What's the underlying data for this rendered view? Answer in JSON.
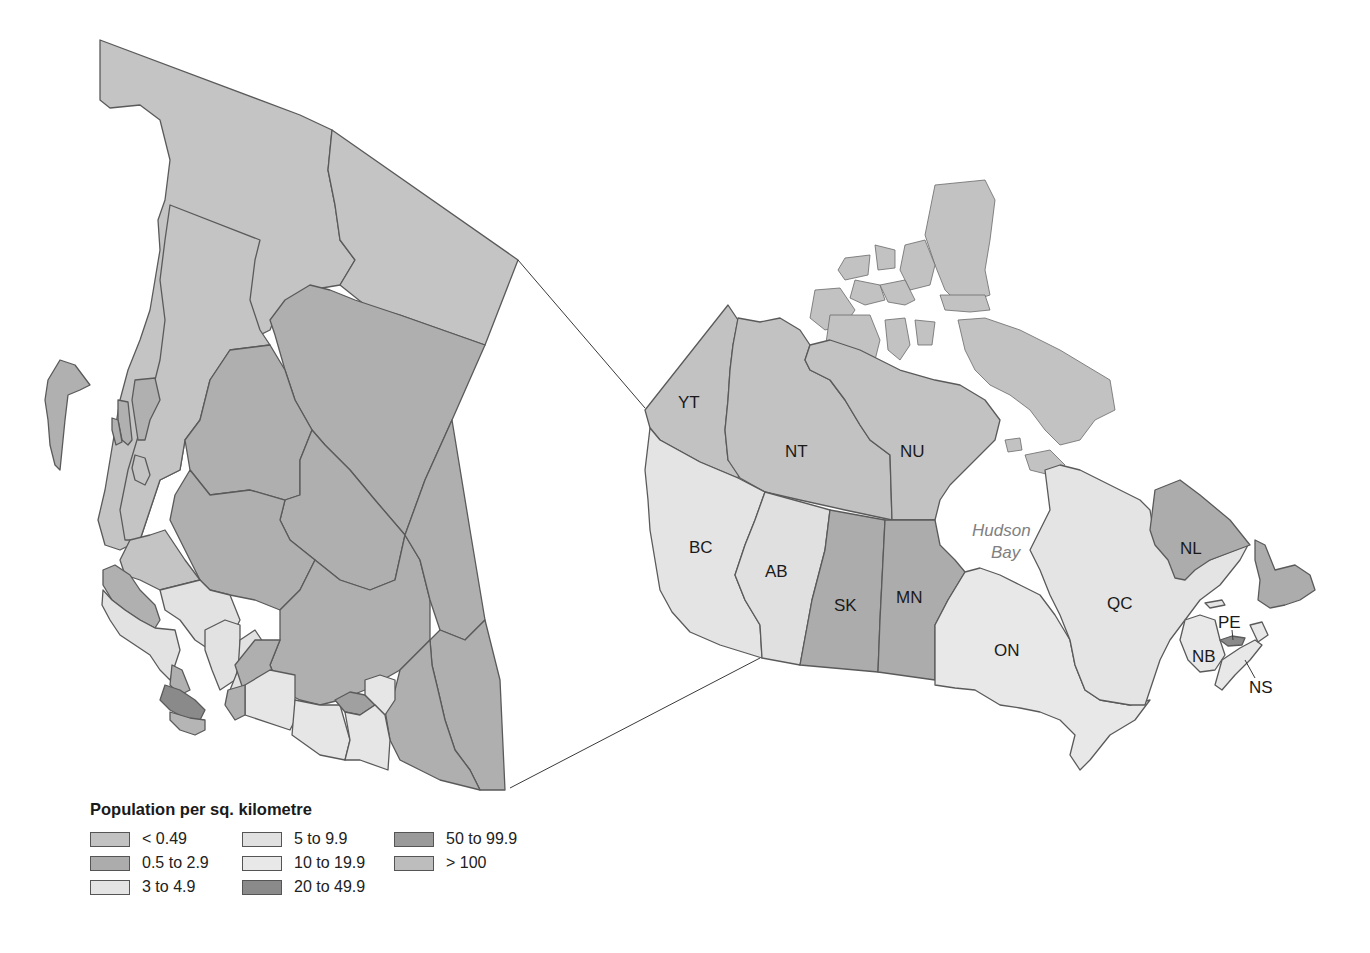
{
  "legend": {
    "title": "Population per sq. kilometre",
    "classes": [
      {
        "label": "< 0.49",
        "color": "#c2c2c2"
      },
      {
        "label": "0.5 to 2.9",
        "color": "#acacac"
      },
      {
        "label": "3 to 4.9",
        "color": "#e4e4e4"
      },
      {
        "label": "5 to 9.9",
        "color": "#e0e0e0"
      },
      {
        "label": "10 to 19.9",
        "color": "#e8e8e8"
      },
      {
        "label": "20 to 49.9",
        "color": "#8a8a8a"
      },
      {
        "label": "50 to 99.9",
        "color": "#9a9a9a"
      },
      {
        "label": "> 100",
        "color": "#bdbdbd"
      }
    ]
  },
  "water_labels": {
    "hudson_bay_line1": "Hudson",
    "hudson_bay_line2": "Bay"
  },
  "provinces": [
    {
      "code": "YT",
      "density_class": "< 0.49"
    },
    {
      "code": "NT",
      "density_class": "< 0.49"
    },
    {
      "code": "NU",
      "density_class": "< 0.49"
    },
    {
      "code": "BC",
      "density_class": "3 to 4.9"
    },
    {
      "code": "AB",
      "density_class": "5 to 9.9"
    },
    {
      "code": "SK",
      "density_class": "0.5 to 2.9"
    },
    {
      "code": "MN",
      "density_class": "0.5 to 2.9"
    },
    {
      "code": "ON",
      "density_class": "10 to 19.9"
    },
    {
      "code": "QC",
      "density_class": "3 to 4.9"
    },
    {
      "code": "NL",
      "density_class": "0.5 to 2.9"
    },
    {
      "code": "NB",
      "density_class": "10 to 19.9"
    },
    {
      "code": "NS",
      "density_class": "10 to 19.9"
    },
    {
      "code": "PE",
      "density_class": "20 to 49.9"
    }
  ],
  "labels": {
    "YT": "YT",
    "NT": "NT",
    "NU": "NU",
    "BC": "BC",
    "AB": "AB",
    "SK": "SK",
    "MN": "MN",
    "ON": "ON",
    "QC": "QC",
    "NL": "NL",
    "PE": "PE",
    "NB": "NB",
    "NS": "NS"
  }
}
